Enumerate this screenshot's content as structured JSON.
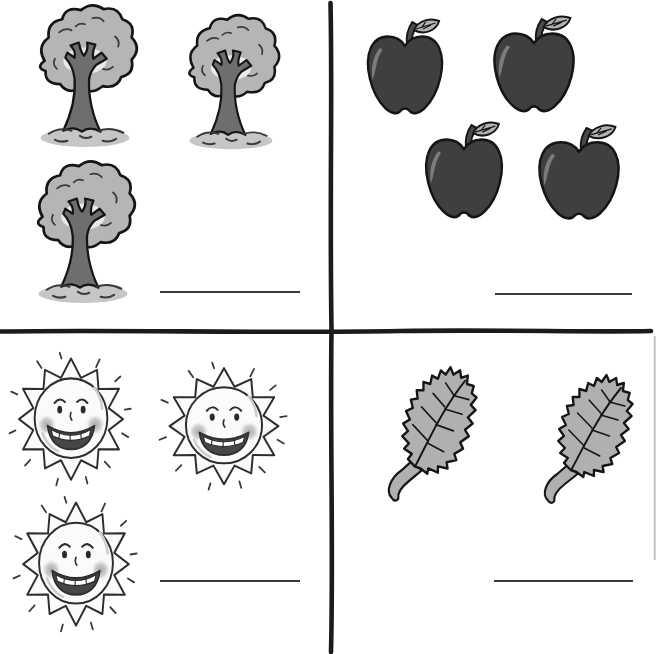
{
  "worksheet": {
    "kind": "counting-worksheet",
    "quadrants": [
      {
        "id": "trees",
        "position": "top-left",
        "item": "tree",
        "item_label": "tree",
        "count": 3,
        "answer": ""
      },
      {
        "id": "apples",
        "position": "top-right",
        "item": "apple",
        "item_label": "apple",
        "count": 4,
        "answer": ""
      },
      {
        "id": "suns",
        "position": "bottom-left",
        "item": "sun",
        "item_label": "sun",
        "count": 3,
        "answer": ""
      },
      {
        "id": "leaves",
        "position": "bottom-right",
        "item": "leaf",
        "item_label": "leaf",
        "count": 2,
        "answer": ""
      }
    ],
    "colors": {
      "background": "#ffffff",
      "divider": "#1b1b1b",
      "answer_line": "#3a3a3a",
      "outline": "#151515",
      "tree_foliage": "#b5b5b5",
      "tree_trunk": "#6e6e6e",
      "tree_ground": "#c6c6c6",
      "apple_body": "#3f3f3f",
      "apple_highlight": "#7c7c7c",
      "apple_leaf": "#b2b2b2",
      "sun_fill": "#fbfbfb",
      "sun_outline": "#2e2e2e",
      "sun_cheek": "#9c9c9c",
      "sun_mouth": "#474747",
      "leaf_fill": "#b0b0b0",
      "page_edge": "#c2c2c2"
    }
  }
}
